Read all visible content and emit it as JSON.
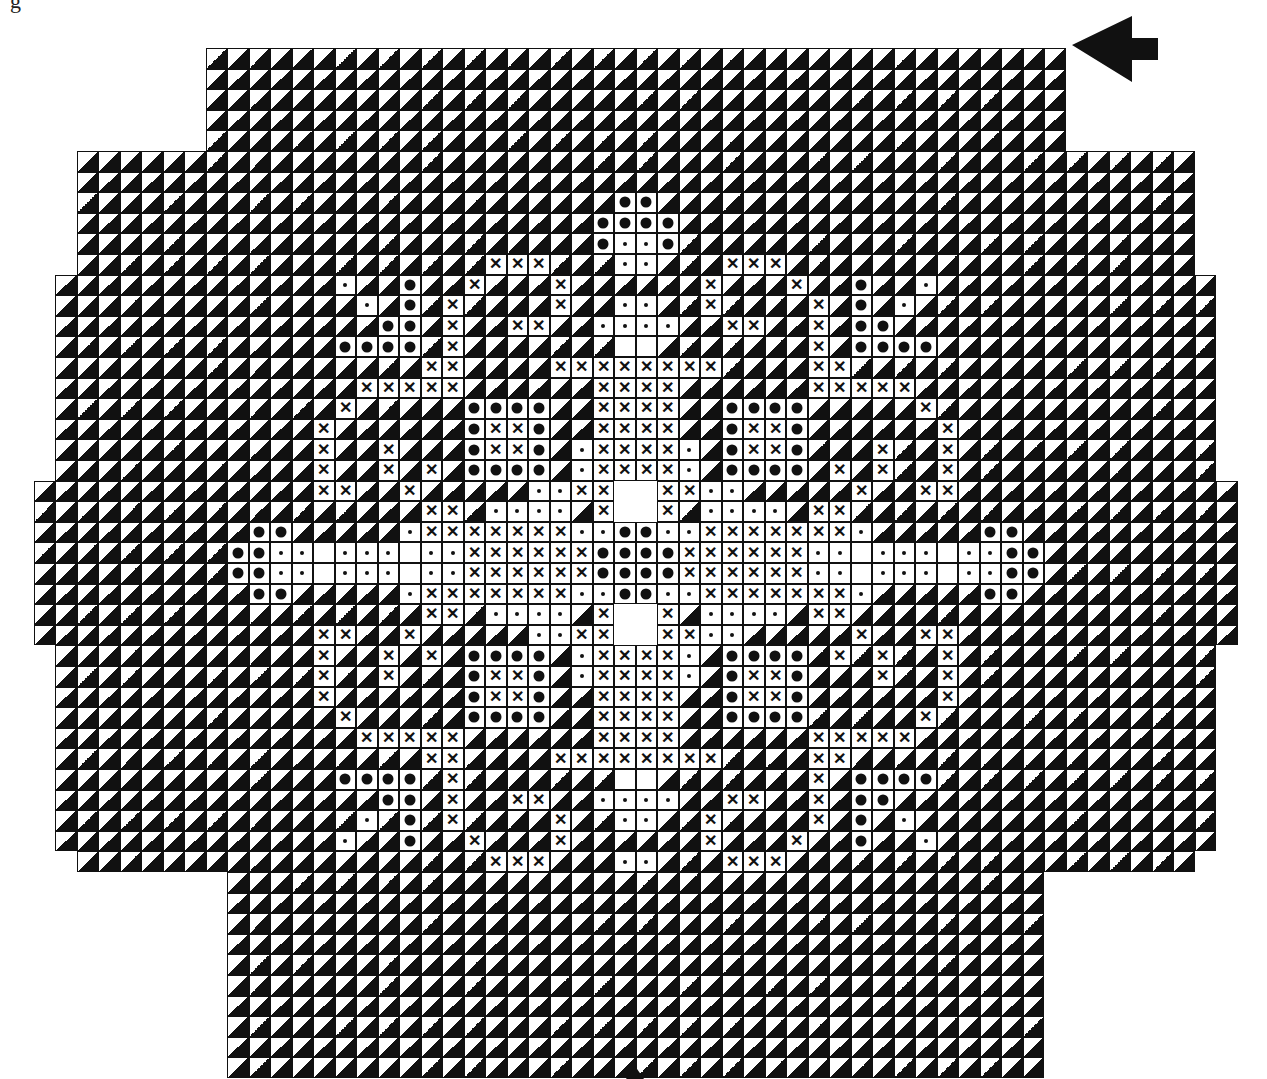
{
  "caption_fragment": "g",
  "legend": {
    "t": "diagonal-half-black-triangle-cell",
    "o": "plain-white-cell",
    "d": "small-dot-cell",
    "B": "large-dot-cell",
    "X": "cross-cell",
    " ": "outside-chart"
  },
  "symbols": {
    "cross": "✕"
  },
  "grid": {
    "cols": 58,
    "rows": 50,
    "cell_w": 21.5,
    "cell_h": 20.6,
    "symmetry": "mirror-horizontal-about-col-28.5-and-vertical-about-row-24.5 for rows 0-39; bottom tier rows 40-49 cols 10-47",
    "left_half_rows_0_to_24": [
      "         tttttttttttttttttttt",
      "         tttttttttttttttttttt",
      "         tttttttttttttttttttt",
      "         tttttttttttttttttttt",
      "         tttttttttttttttttttt",
      "   tttttttttttttttttttttttttt",
      "   tttttttttttttttttttttttttt",
      "   tttttttttttttttttttttttttB",
      "   ttttttttttttttttttttttttBB",
      "   ttttttttttttttttttttttttBd",
      "   tttttttttttttttttttXXXtttd",
      "  tttttttttttttdttBttXtttXttt",
      "  ttttttttttttttdtBtXttttXttd",
      "  tttttttttttttttBBtXttXXttdd",
      "  tttttttttttttBBBBtXttttttto",
      "  tttttttttttttttttXXttttXXXX",
      "  ttttttttttttttXXXXXttttttXX",
      "  tttttttttttttXtttttBBBBttXX",
      "  ttttttttttttXttttttBXXBttXX",
      "  ttttttttttttXttXtttBXXBtdXX",
      "  ttttttttttttXttXtXtBBBBtdXX",
      " tttttttttttttXXttXtttttddXX",
      " ttttttttttttttttttXXtddddtX",
      " ttttttttttBBtttttdXXXXXXXddB",
      " tttttttttBBddodddoddXXXXXXBB"
    ],
    "bottom_rows_40_to_49": [
      "          tttttttttttttttttttttttttttttttttttttt",
      "          tttttttttttttttttttttttttttttttttttttt",
      "          tttttttttttttttttttttttttttttttttttttt",
      "          tttttttttttttttttttttttttttttttttttttt",
      "          tttttttttttttttttttttttttttttttttttttt",
      "          tttttttttttttttttttttttttttttttttttttt",
      "          tttttttttttttttttttttttttttttttttttttt",
      "          tttttttttttttttttttttttttttttttttttttt",
      "          tttttttttttttttttttttttttttttttttttttt",
      "          tttttttttttttttttttttttttttttttttttttt"
    ]
  },
  "markers": {
    "top_right_arrow": "arrow-left-pointer",
    "bottom_center_arrow": "arrow-up-pointer"
  },
  "colors": {
    "ink": "#111111",
    "paper": "#ffffff"
  }
}
